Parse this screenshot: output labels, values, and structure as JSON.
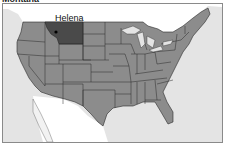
{
  "title": "Montana",
  "map": {
    "highlighted_state": "Montana",
    "capital_label": "Helena",
    "colors": {
      "ocean": "#e4e4e4",
      "land_other": "#ffffff",
      "states": "#8c8c8c",
      "highlight": "#4a4a4a",
      "borders": "#2a2a2a",
      "frame": "#8a8a8a"
    }
  }
}
